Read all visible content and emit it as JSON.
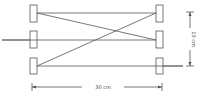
{
  "diagram": {
    "type": "optical/geometric setup schematic",
    "left_column_boxes": 3,
    "right_column_boxes": 3,
    "connections": [
      {
        "from": "left-top",
        "to": "right-top",
        "style": "horizontal"
      },
      {
        "from": "left-top",
        "to": "right-middle",
        "style": "diagonal"
      },
      {
        "from": "left-bottom",
        "to": "right-top",
        "style": "diagonal"
      },
      {
        "from": "left-bottom",
        "to": "right-bottom",
        "style": "horizontal"
      },
      {
        "from": "left-edge",
        "to": "right-middle",
        "style": "horizontal through middle row"
      }
    ],
    "dimensions": {
      "horizontal_label": "30 cm",
      "vertical_label": "10 cm"
    }
  },
  "colors": {
    "line": "#555555",
    "background": "#ffffff"
  }
}
